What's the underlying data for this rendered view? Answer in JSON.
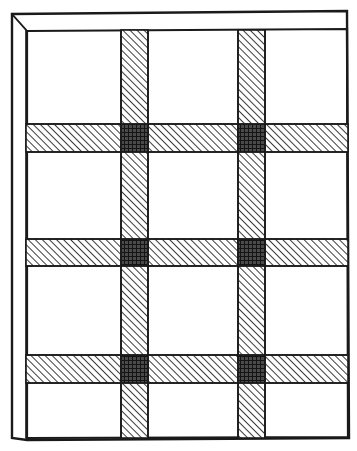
{
  "diagram": {
    "kind": "line-drawing",
    "canvas": {
      "width": 357,
      "height": 451
    },
    "colors": {
      "background": "#ffffff",
      "ink": "#1a1a1a",
      "hatch": "#1a1a1a",
      "node_fill": "#2a2a2a"
    },
    "frame": {
      "label": "outer wall frame",
      "outer": {
        "x": 11,
        "y": 13,
        "width": 337,
        "height": 425
      },
      "inner": {
        "x": 26,
        "y": 30,
        "width": 322,
        "height": 408
      },
      "corner_bevel": "top-left",
      "stroke_width": 2.2
    },
    "hatch": {
      "angle_deg": 45,
      "direction": "up-right",
      "spacing_px": 5,
      "line_width_px": 1.6
    },
    "beams": {
      "vertical": [
        {
          "name": "vertical-beam-1",
          "x": 121,
          "width": 27,
          "y": 30,
          "height": 408
        },
        {
          "name": "vertical-beam-2",
          "x": 238,
          "width": 27,
          "y": 30,
          "height": 408
        }
      ],
      "horizontal": [
        {
          "name": "horizontal-beam-1",
          "y": 124,
          "height": 28,
          "x": 26,
          "width": 322
        },
        {
          "name": "horizontal-beam-2",
          "y": 239,
          "height": 27,
          "x": 26,
          "width": 322
        },
        {
          "name": "horizontal-beam-3",
          "y": 355,
          "height": 28,
          "x": 26,
          "width": 322
        }
      ]
    },
    "nodes": [
      {
        "name": "node-r1-c1",
        "x": 121,
        "y": 124,
        "width": 27,
        "height": 28
      },
      {
        "name": "node-r1-c2",
        "x": 238,
        "y": 124,
        "width": 27,
        "height": 28
      },
      {
        "name": "node-r2-c1",
        "x": 121,
        "y": 239,
        "width": 27,
        "height": 27
      },
      {
        "name": "node-r2-c2",
        "x": 238,
        "y": 239,
        "width": 27,
        "height": 27
      },
      {
        "name": "node-r3-c1",
        "x": 121,
        "y": 355,
        "width": 27,
        "height": 28
      },
      {
        "name": "node-r3-c2",
        "x": 238,
        "y": 355,
        "width": 27,
        "height": 28
      }
    ],
    "panels": {
      "rows": 4,
      "columns": 3,
      "count": 12,
      "fill": "#ffffff"
    }
  }
}
